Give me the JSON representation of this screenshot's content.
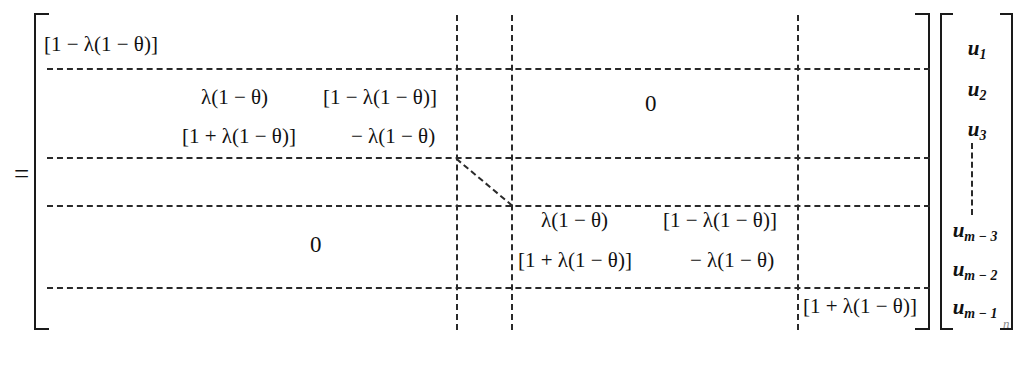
{
  "equation": {
    "relation": "=",
    "vector_subscript": "n",
    "matrix": {
      "zero_label": "0",
      "blocks": {
        "top_left_corner": "[1 − λ(1 − θ)]",
        "bottom_right_corner": "[1 + λ(1 − θ)]",
        "upper_block": {
          "row1_col1": "λ(1 − θ)",
          "row1_col2": "[1 − λ(1 − θ)]",
          "row2_col1": "[1 + λ(1 − θ)]",
          "row2_col2": "− λ(1 − θ)"
        },
        "lower_block": {
          "row1_col1": "λ(1 − θ)",
          "row1_col2": "[1 − λ(1 − θ)]",
          "row2_col1": "[1 + λ(1 − θ)]",
          "row2_col2": "− λ(1 − θ)"
        }
      }
    },
    "vector": {
      "entries": [
        {
          "symbol": "u",
          "subscript": "1"
        },
        {
          "symbol": "u",
          "subscript": "2"
        },
        {
          "symbol": "u",
          "subscript": "3"
        },
        {
          "symbol": "u",
          "subscript": "m − 3"
        },
        {
          "symbol": "u",
          "subscript": "m − 2"
        },
        {
          "symbol": "u",
          "subscript": "m − 1"
        }
      ],
      "ellipsis": "⋮"
    }
  }
}
